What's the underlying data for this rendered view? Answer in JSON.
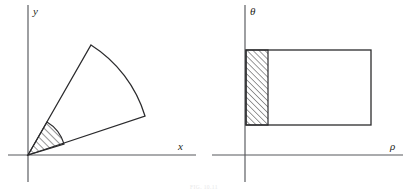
{
  "figure": {
    "caption": "FIG. 10.11",
    "width": 408,
    "height": 190,
    "background_color": "#ffffff",
    "ink_color": "#2b2b2d",
    "axis_color": "#56585c"
  },
  "left_panel": {
    "name": "cartesian-xy-plane",
    "axes": {
      "x_label": "x",
      "y_label": "y",
      "origin": {
        "x": 28,
        "y": 155
      },
      "x_axis": {
        "x1": 8,
        "y1": 155,
        "x2": 196,
        "y2": 155
      },
      "y_axis": {
        "x1": 28,
        "y1": 5,
        "x2": 28,
        "y2": 182
      },
      "x_label_pos": {
        "x": 180,
        "y": 149
      },
      "y_label_pos": {
        "x": 33,
        "y": 14
      }
    },
    "sector": {
      "name": "annular-sector-region",
      "description": "circular sector bounded by two radii and an outer arc",
      "inner_wedge_shaded": true,
      "vertices": {
        "origin": {
          "x": 28,
          "y": 155
        },
        "upper_radius_end": {
          "x": 91,
          "y": 45
        },
        "lower_radius_end": {
          "x": 145,
          "y": 116
        }
      },
      "arc": {
        "rx": 128,
        "ry": 128,
        "sweep": 1
      },
      "path": "M 28 155 L 91 45 A 128 128 0 0 1 145 116 Z",
      "fill": "#ffffff",
      "stroke": "#2b2b2d"
    },
    "angle_wedge": {
      "name": "shaded-angle-wedge",
      "description": "small hatched wedge at origin marking the angular interval",
      "path": "M 28 155 L 47 122 A 38 38 0 0 1 64 144 Z",
      "hatch_fill": true,
      "stroke": "#2b2b2d"
    }
  },
  "right_panel": {
    "name": "polar-parameter-rho-theta-plane",
    "axes": {
      "x_label": "ρ",
      "y_label": "θ",
      "origin": {
        "x": 245,
        "y": 155
      },
      "x_axis": {
        "x1": 212,
        "y1": 155,
        "x2": 403,
        "y2": 155
      },
      "y_axis": {
        "x1": 245,
        "y1": 5,
        "x2": 245,
        "y2": 182
      },
      "x_label_pos": {
        "x": 392,
        "y": 149
      },
      "y_label_pos": {
        "x": 250,
        "y": 14
      }
    },
    "rectangle": {
      "name": "parameter-rectangle",
      "description": "image of the sector under the polar coordinate map",
      "left": 246,
      "top": 50,
      "right": 371,
      "bottom": 125,
      "width": 125,
      "height": 75,
      "fill": "#ffffff",
      "stroke": "#2b2b2d"
    },
    "hatched_band": {
      "name": "hatched-theta-band",
      "description": "narrow diagonally hatched strip along the theta axis edge of the rectangle",
      "left": 246,
      "top": 50,
      "right": 268,
      "bottom": 125,
      "width": 22,
      "height": 75,
      "hatch_direction": "lower-left-to-upper-right",
      "stroke": "#2b2b2d"
    }
  }
}
